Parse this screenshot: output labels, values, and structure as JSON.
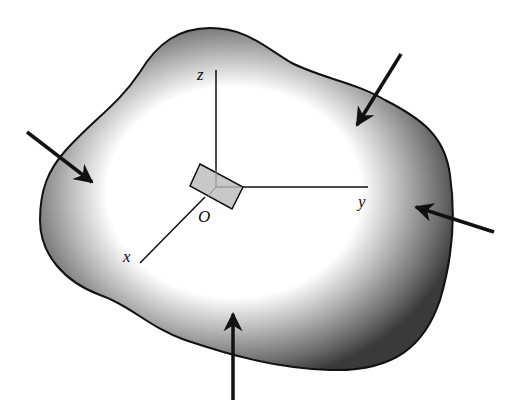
{
  "diagram": {
    "type": "free-body stress element",
    "axes": {
      "z_label": "z",
      "y_label": "y",
      "x_label": "x",
      "origin_label": "O"
    },
    "colors": {
      "outline": "#111111",
      "shade_dark": "#3a3a3a",
      "shade_light": "#ffffff",
      "element_fill": "#c8c8c8"
    },
    "forces": [
      {
        "id": "left",
        "direction": "inward, down-right"
      },
      {
        "id": "top-right",
        "direction": "inward, down-left"
      },
      {
        "id": "right",
        "direction": "inward, left"
      },
      {
        "id": "bottom",
        "direction": "inward, up"
      }
    ]
  }
}
